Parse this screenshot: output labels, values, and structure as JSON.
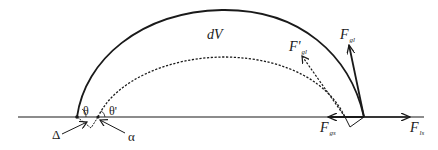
{
  "diagram": {
    "colors": {
      "stroke": "#1a1a1a",
      "background": "#ffffff"
    },
    "labels": {
      "volume": "dV",
      "theta": "θ",
      "theta_prime": "θ'",
      "delta": "Δ",
      "alpha": "α",
      "F_gl": {
        "main": "F",
        "sub": "gl"
      },
      "F_gl_prime": {
        "main": "F'",
        "sub": "gl"
      },
      "F_gs": {
        "main": "F",
        "sub": "gs"
      },
      "F_ls": {
        "main": "F",
        "sub": "ls"
      }
    },
    "elements": {
      "baseline": "solid horizontal surface line with arrow to the right",
      "outer_profile": "solid droplet arc",
      "inner_profile": "dashed droplet arc",
      "vectors": [
        "F_gl (solid)",
        "F'_gl (dashed)",
        "F_gs (left)",
        "F_ls (right)"
      ]
    }
  }
}
